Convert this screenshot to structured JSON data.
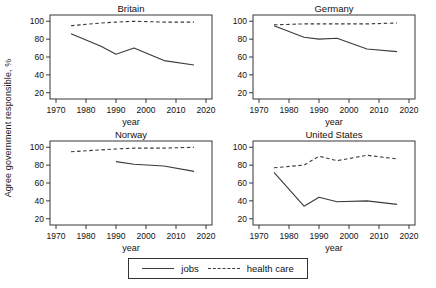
{
  "figure": {
    "ylabel": "Agree government responsible, %",
    "xlabel": "year",
    "background": "#ffffff",
    "line_color": "#3a3a3a",
    "frame_color": "#222222"
  },
  "legend": {
    "position": "bottom-center",
    "boxed": true,
    "jobs_label": "jobs",
    "health_label": "health care",
    "jobs_style": "solid",
    "health_style": "dashed"
  },
  "axes": {
    "xlim": [
      1968,
      2022
    ],
    "ylim": [
      13,
      107
    ],
    "xticks": [
      1970,
      1980,
      1990,
      2000,
      2010,
      2020
    ],
    "yticks": [
      20,
      40,
      60,
      80,
      100
    ],
    "grid": false
  },
  "chart_data": [
    {
      "type": "line",
      "title": "Britain",
      "xlabel": "year",
      "ylabel": "Agree government responsible, %",
      "xlim": [
        1968,
        2022
      ],
      "ylim": [
        13,
        107
      ],
      "series": [
        {
          "name": "jobs",
          "style": "solid",
          "x": [
            1975,
            1985,
            1990,
            1996,
            2006,
            2016
          ],
          "y": [
            86,
            72,
            63,
            70,
            56,
            51
          ]
        },
        {
          "name": "health care",
          "style": "dashed",
          "x": [
            1975,
            1985,
            1990,
            1996,
            2006,
            2016
          ],
          "y": [
            95,
            98,
            99,
            100,
            99,
            99
          ]
        }
      ]
    },
    {
      "type": "line",
      "title": "Germany",
      "xlabel": "year",
      "ylabel": "Agree government responsible, %",
      "xlim": [
        1968,
        2022
      ],
      "ylim": [
        13,
        107
      ],
      "series": [
        {
          "name": "jobs",
          "style": "solid",
          "x": [
            1975,
            1985,
            1990,
            1996,
            2006,
            2016
          ],
          "y": [
            95,
            82,
            80,
            81,
            69,
            66
          ]
        },
        {
          "name": "health care",
          "style": "dashed",
          "x": [
            1975,
            1985,
            1990,
            1996,
            2006,
            2016
          ],
          "y": [
            96,
            97,
            97,
            97,
            97,
            98
          ]
        }
      ]
    },
    {
      "type": "line",
      "title": "Norway",
      "xlabel": "year",
      "ylabel": "Agree government responsible, %",
      "xlim": [
        1968,
        2022
      ],
      "ylim": [
        13,
        107
      ],
      "series": [
        {
          "name": "jobs",
          "style": "solid",
          "x": [
            1990,
            1996,
            2006,
            2016
          ],
          "y": [
            84,
            81,
            79,
            73
          ]
        },
        {
          "name": "health care",
          "style": "dashed",
          "x": [
            1975,
            1985,
            1990,
            1996,
            2006,
            2016
          ],
          "y": [
            95,
            97,
            98,
            99,
            99,
            100
          ]
        }
      ]
    },
    {
      "type": "line",
      "title": "United States",
      "xlabel": "year",
      "ylabel": "Agree government responsible, %",
      "xlim": [
        1968,
        2022
      ],
      "ylim": [
        13,
        107
      ],
      "series": [
        {
          "name": "jobs",
          "style": "solid",
          "x": [
            1975,
            1985,
            1990,
            1996,
            2006,
            2016
          ],
          "y": [
            72,
            34,
            44,
            39,
            40,
            36
          ]
        },
        {
          "name": "health care",
          "style": "dashed",
          "x": [
            1975,
            1985,
            1990,
            1996,
            2006,
            2016
          ],
          "y": [
            77,
            80,
            90,
            85,
            91,
            87
          ]
        }
      ]
    }
  ]
}
